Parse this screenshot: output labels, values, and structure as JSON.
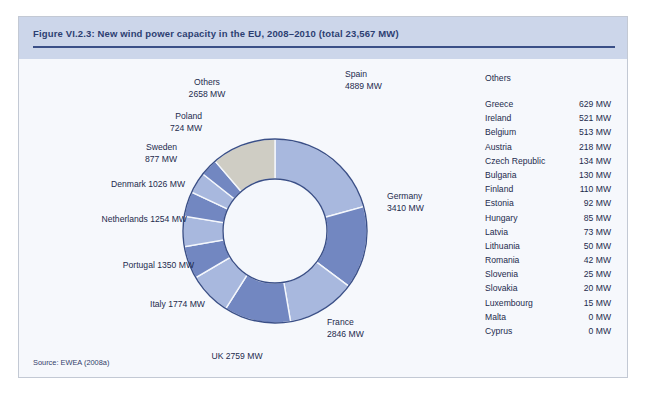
{
  "figure": {
    "title": "Figure VI.2.3: New wind power capacity in the EU, 2008–2010 (total 23,567 MW)",
    "source": "Source: EWEA (2008a)",
    "others_heading": "Others"
  },
  "colors": {
    "header_band": "#ccd6ea",
    "title_text": "#2c3f72",
    "title_rule": "#3a4f87",
    "card_background": "#f6f8fc",
    "card_border": "#c3c9d4",
    "slice_light": "#a8b8de",
    "slice_medium": "#7287c1",
    "slice_others": "#cfcdc4",
    "slice_stroke": "#3a4f87",
    "hole_fill": "#f4f7fc",
    "label_text": "#1d2b4d"
  },
  "chart_data": {
    "type": "pie",
    "title": "New wind power capacity in the EU, 2008–2010 (total 23,567 MW)",
    "unit": "MW",
    "total": 23567,
    "donut": true,
    "start_angle_deg": 0,
    "direction": "clockwise",
    "legend": "none",
    "labels": [
      "Spain",
      "Germany",
      "France",
      "UK",
      "Italy",
      "Portugal",
      "Netherlands",
      "Denmark",
      "Sweden",
      "Poland",
      "Others"
    ],
    "values": [
      4889,
      3410,
      2846,
      2759,
      1774,
      1350,
      1254,
      1026,
      877,
      724,
      2658
    ],
    "slice_labels": [
      "Spain\n4889 MW",
      "Germany\n3410 MW",
      "France\n2846 MW",
      "UK 2759 MW",
      "Italy 1774 MW",
      "Portugal 1350 MW",
      "Netherlands 1254 MW",
      "Denmark 1026 MW",
      "Sweden\n877 MW",
      "Poland\n724 MW",
      "Others\n2658 MW"
    ],
    "slice_colors": [
      "#a8b8de",
      "#7287c1",
      "#a8b8de",
      "#7287c1",
      "#a8b8de",
      "#7287c1",
      "#a8b8de",
      "#7287c1",
      "#a8b8de",
      "#7287c1",
      "#cfcdc4"
    ]
  },
  "others_table": {
    "rows": [
      {
        "country": "Greece",
        "value": "629 MW"
      },
      {
        "country": "Ireland",
        "value": "521 MW"
      },
      {
        "country": "Belgium",
        "value": "513 MW"
      },
      {
        "country": "Austria",
        "value": "218 MW"
      },
      {
        "country": "Czech Republic",
        "value": "134 MW"
      },
      {
        "country": "Bulgaria",
        "value": "130 MW"
      },
      {
        "country": "Finland",
        "value": "110 MW"
      },
      {
        "country": "Estonia",
        "value": "92 MW"
      },
      {
        "country": "Hungary",
        "value": "85 MW"
      },
      {
        "country": "Latvia",
        "value": "73 MW"
      },
      {
        "country": "Lithuania",
        "value": "50 MW"
      },
      {
        "country": "Romania",
        "value": "42 MW"
      },
      {
        "country": "Slovenia",
        "value": "25 MW"
      },
      {
        "country": "Slovakia",
        "value": "20 MW"
      },
      {
        "country": "Luxembourg",
        "value": "15 MW"
      },
      {
        "country": "Malta",
        "value": "0 MW"
      },
      {
        "country": "Cyprus",
        "value": "0 MW"
      }
    ]
  },
  "label_positions": [
    {
      "left": 318,
      "top": 10,
      "width": 95,
      "align": "ta-left"
    },
    {
      "left": 360,
      "top": 132,
      "width": 95,
      "align": "ta-left"
    },
    {
      "left": 300,
      "top": 258,
      "width": 95,
      "align": "ta-left"
    },
    {
      "left": 155,
      "top": 292,
      "width": 110,
      "align": "ta-center"
    },
    {
      "left": 58,
      "top": 240,
      "width": 120,
      "align": "ta-right"
    },
    {
      "left": 22,
      "top": 201,
      "width": 145,
      "align": "ta-right"
    },
    {
      "left": 0,
      "top": 155,
      "width": 160,
      "align": "ta-right"
    },
    {
      "left": 10,
      "top": 120,
      "width": 148,
      "align": "ta-right"
    },
    {
      "left": 40,
      "top": 83,
      "width": 110,
      "align": "ta-right"
    },
    {
      "left": 65,
      "top": 52,
      "width": 110,
      "align": "ta-right"
    },
    {
      "left": 125,
      "top": 18,
      "width": 110,
      "align": "ta-center"
    }
  ]
}
